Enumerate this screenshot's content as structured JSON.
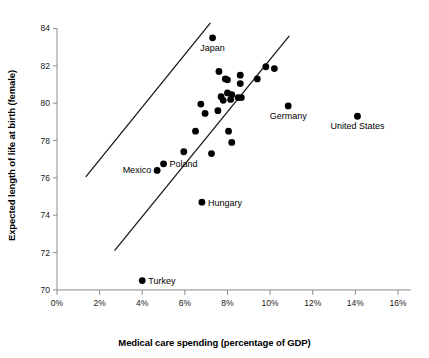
{
  "chart_data": {
    "type": "scatter",
    "title": "",
    "xlabel": "Medical care spending (percentage of GDP)",
    "ylabel": "Expected length of life at birth (female)",
    "xlim": [
      0,
      16.8
    ],
    "ylim": [
      69.3,
      84.4
    ],
    "grid": false,
    "legend": "none",
    "xticks": [
      0,
      2,
      4,
      6,
      8,
      10,
      12,
      14,
      16
    ],
    "xtick_labels": [
      "0%",
      "2%",
      "4%",
      "6%",
      "8%",
      "10%",
      "12%",
      "14%",
      "16%"
    ],
    "yticks": [
      70,
      72,
      74,
      76,
      78,
      80,
      82,
      84
    ],
    "ytick_labels": [
      "70",
      "72",
      "74",
      "76",
      "78",
      "80",
      "82",
      "84"
    ],
    "points": [
      {
        "x": 7.3,
        "y": 83.5,
        "label": "Japan",
        "label_pos": "below"
      },
      {
        "x": 7.6,
        "y": 81.7,
        "label": null
      },
      {
        "x": 8.6,
        "y": 81.5,
        "label": null
      },
      {
        "x": 7.9,
        "y": 81.3,
        "label": null
      },
      {
        "x": 8.0,
        "y": 81.25,
        "label": null
      },
      {
        "x": 9.4,
        "y": 81.3,
        "label": null
      },
      {
        "x": 9.8,
        "y": 81.95,
        "label": null
      },
      {
        "x": 10.2,
        "y": 81.85,
        "label": null
      },
      {
        "x": 8.6,
        "y": 81.05,
        "label": null
      },
      {
        "x": 8.0,
        "y": 80.55,
        "label": null
      },
      {
        "x": 8.2,
        "y": 80.45,
        "label": null
      },
      {
        "x": 7.7,
        "y": 80.35,
        "label": null
      },
      {
        "x": 7.8,
        "y": 80.15,
        "label": null
      },
      {
        "x": 8.15,
        "y": 80.2,
        "label": null
      },
      {
        "x": 8.5,
        "y": 80.3,
        "label": null
      },
      {
        "x": 8.65,
        "y": 80.3,
        "label": null
      },
      {
        "x": 6.75,
        "y": 79.95,
        "label": null
      },
      {
        "x": 7.55,
        "y": 79.6,
        "label": null
      },
      {
        "x": 6.95,
        "y": 79.45,
        "label": null
      },
      {
        "x": 10.85,
        "y": 79.85,
        "label": "Germany",
        "label_pos": "below"
      },
      {
        "x": 14.1,
        "y": 79.3,
        "label": "United States",
        "label_pos": "below"
      },
      {
        "x": 6.5,
        "y": 78.5,
        "label": null
      },
      {
        "x": 8.05,
        "y": 78.5,
        "label": null
      },
      {
        "x": 8.2,
        "y": 77.9,
        "label": null
      },
      {
        "x": 5.95,
        "y": 77.4,
        "label": null
      },
      {
        "x": 7.25,
        "y": 77.3,
        "label": null
      },
      {
        "x": 5.0,
        "y": 76.75,
        "label": "Poland",
        "label_pos": "right"
      },
      {
        "x": 4.7,
        "y": 76.4,
        "label": "Mexico",
        "label_pos": "left"
      },
      {
        "x": 6.8,
        "y": 74.7,
        "label": "Hungary",
        "label_pos": "right"
      },
      {
        "x": 4.0,
        "y": 70.5,
        "label": "Turkey",
        "label_pos": "right"
      }
    ],
    "boundary_lines": [
      {
        "name": "upper-band-line",
        "x1": 1.35,
        "y1": 76.05,
        "x2": 7.2,
        "y2": 84.3
      },
      {
        "name": "lower-band-line",
        "x1": 2.7,
        "y1": 72.1,
        "x2": 10.9,
        "y2": 83.6
      }
    ],
    "marker_color": "#000000",
    "line_color": "#1a1a1a",
    "axis_color": "#8c8c8c"
  }
}
